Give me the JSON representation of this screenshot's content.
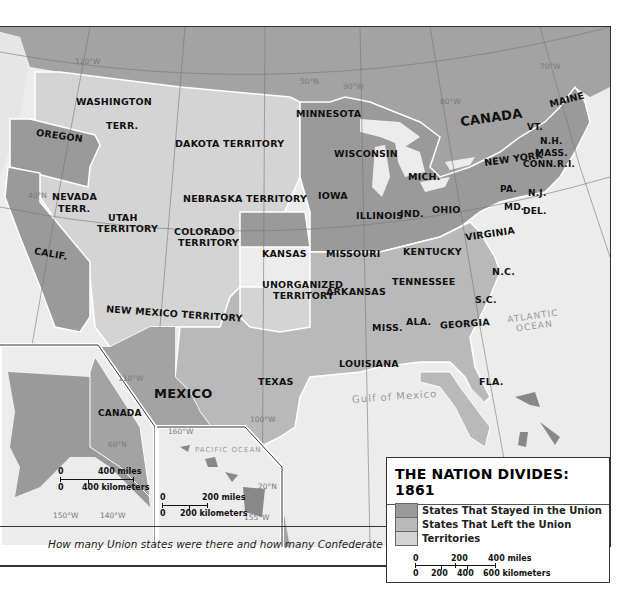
{
  "title": "THE NATION DIVIDES: 1861",
  "legend": {
    "title": "THE NATION DIVIDES: 1861",
    "items": [
      {
        "label": "States That Stayed in the Union",
        "color": "#9a9a9a"
      },
      {
        "label": "States That Left the Union",
        "color": "#b9b9b9"
      },
      {
        "label": "Territories",
        "color": "#d4d4d4"
      }
    ],
    "scale": {
      "miles": [
        "0",
        "200",
        "400 miles"
      ],
      "km": [
        "0",
        "200",
        "400",
        "600 kilometers"
      ]
    }
  },
  "colors": {
    "union": "#9a9a9a",
    "confederate": "#b9b9b9",
    "territory": "#d4d4d4",
    "foreign": "#a3a3a3",
    "water": "#ececec",
    "border": "#ffffff"
  },
  "labels": {
    "union_states": [
      "OREGON",
      "CALIF.",
      "MINNESOTA",
      "WISCONSIN",
      "IOWA",
      "KANSAS",
      "MISSOURI",
      "ILLINOIS",
      "IND.",
      "OHIO",
      "MICH.",
      "KENTUCKY",
      "PA.",
      "NEW YORK",
      "VT.",
      "N.H.",
      "MASS.",
      "CONN.",
      "R.I.",
      "MAINE",
      "N.J.",
      "MD.",
      "DEL."
    ],
    "confederate_states": [
      "VIRGINIA",
      "N.C.",
      "TENNESSEE",
      "ARKANSAS",
      "S.C.",
      "GEORGIA",
      "ALA.",
      "MISS.",
      "LOUISIANA",
      "TEXAS",
      "FLA."
    ],
    "territories": [
      "WASHINGTON TERR.",
      "DAKOTA TERRITORY",
      "NEBRASKA TERRITORY",
      "NEVADA TERR.",
      "UTAH TERRITORY",
      "COLORADO TERRITORY",
      "NEW MEXICO TERRITORY",
      "UNORGANIZED TERRITORY"
    ],
    "countries": [
      "CANADA",
      "MEXICO"
    ],
    "water": [
      "ATLANTIC OCEAN",
      "Gulf of Mexico",
      "PACIFIC OCEAN"
    ],
    "gridlines": [
      "50°N",
      "40°N",
      "30°N",
      "20°N",
      "60°N",
      "120°W",
      "110°W",
      "100°W",
      "90°W",
      "80°W",
      "70°W",
      "150°W",
      "140°W",
      "160°W",
      "155°W"
    ]
  },
  "map": {
    "washington": "WASHINGTON",
    "terr": "TERR.",
    "oregon": "OREGON",
    "dakota": "DAKOTA TERRITORY",
    "minnesota": "MINNESOTA",
    "wisconsin": "WISCONSIN",
    "canada": "CANADA",
    "mich": "MICH.",
    "newyork": "NEW YORK",
    "maine": "MAINE",
    "vt": "VT.",
    "nh": "N.H.",
    "mass": "MASS.",
    "conn": "CONN.",
    "ri": "R.I.",
    "nevada": "NEVADA",
    "nevada_terr": "TERR.",
    "nebraska": "NEBRASKA TERRITORY",
    "iowa": "IOWA",
    "illinois": "ILLINOIS",
    "ind": "IND.",
    "ohio": "OHIO",
    "pa": "PA.",
    "nj": "N.J.",
    "md": "MD.",
    "del": "DEL.",
    "utah": "UTAH",
    "territory": "TERRITORY",
    "colorado": "COLORADO",
    "calif": "CALIF.",
    "kansas": "KANSAS",
    "missouri": "MISSOURI",
    "kentucky": "KENTUCKY",
    "virginia": "VIRGINIA",
    "unorganized": "UNORGANIZED",
    "arkansas": "ARKANSAS",
    "tennessee": "TENNESSEE",
    "nc": "N.C.",
    "sc": "S.C.",
    "newmexico": "NEW MEXICO TERRITORY",
    "miss": "MISS.",
    "ala": "ALA.",
    "georgia": "GEORGIA",
    "texas": "TEXAS",
    "louisiana": "LOUISIANA",
    "fla": "FLA.",
    "mexico": "MEXICO",
    "canada_inset": "CANADA",
    "atlantic": "ATLANTIC",
    "ocean": "OCEAN",
    "gulf": "Gulf of Mexico",
    "pacific": "PACIFIC OCEAN",
    "g50": "50°N",
    "g50b": "50°N",
    "g40": "40°N",
    "g120": "120°W",
    "g90": "90°W",
    "g80": "80°W",
    "g70": "70°W",
    "g110": "110°W",
    "g100": "100°W",
    "g30": "30°W",
    "g60": "60°N",
    "g150": "150°W",
    "g140": "140°W",
    "g160": "160°W",
    "g20": "20°N",
    "g155": "155°W"
  },
  "alaska_scale": {
    "top0": "0",
    "miles": "400 miles",
    "bot0": "0",
    "km": "400 kilometers"
  },
  "hawaii_scale": {
    "top0": "0",
    "miles": "200 miles",
    "bot0": "0",
    "km": "200 kilometers"
  },
  "question": "How many Union states were there and how many Confederate states?"
}
